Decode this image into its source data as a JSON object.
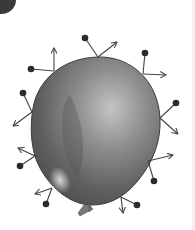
{
  "diagram": {
    "colors": {
      "background": "#ffffff",
      "balloon_dark": "#4a4a4a",
      "balloon_mid": "#7a7a7a",
      "balloon_light": "#c8c8c8",
      "outline": "#3c3c3c",
      "particle": "#2b2b2b",
      "arrow": "#444444",
      "badge": "#3a3a3a"
    },
    "particles": [
      {
        "name": "particle-top-left",
        "dot": [
          31,
          69
        ],
        "contact": [
          54,
          71
        ],
        "arrow_end": [
          54,
          48
        ]
      },
      {
        "name": "particle-top",
        "dot": [
          85,
          38
        ],
        "contact": [
          98,
          57
        ],
        "arrow_end": [
          117,
          42
        ]
      },
      {
        "name": "particle-top-right",
        "dot": [
          145,
          53
        ],
        "contact": [
          143,
          74
        ],
        "arrow_end": [
          166,
          75
        ]
      },
      {
        "name": "particle-right",
        "dot": [
          176,
          103
        ],
        "contact": [
          160,
          118
        ],
        "arrow_end": [
          178,
          134
        ]
      },
      {
        "name": "particle-right-lower",
        "dot": [
          154,
          181
        ],
        "contact": [
          148,
          161
        ],
        "arrow_end": [
          173,
          155
        ]
      },
      {
        "name": "particle-bottom-right",
        "dot": [
          137,
          205
        ],
        "contact": [
          121,
          197
        ],
        "arrow_end": [
          123,
          213
        ]
      },
      {
        "name": "particle-left",
        "dot": [
          23,
          93
        ],
        "contact": [
          32,
          112
        ],
        "arrow_end": [
          13,
          126
        ]
      },
      {
        "name": "particle-left-lower",
        "dot": [
          20,
          166
        ],
        "contact": [
          35,
          156
        ],
        "arrow_end": [
          18,
          148
        ]
      },
      {
        "name": "particle-bottom-left",
        "dot": [
          46,
          204
        ],
        "contact": [
          52,
          188
        ],
        "arrow_end": [
          35,
          194
        ]
      }
    ]
  }
}
